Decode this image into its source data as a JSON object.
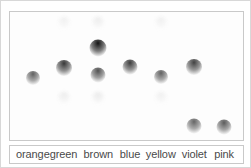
{
  "figure": {
    "kind": "paper-chromatography-plate",
    "plate_background": "#fdfdfd",
    "frame_color": "#c9c9c9",
    "outer_border_color": "#d8d8d8"
  },
  "legend": {
    "labels": [
      {
        "text": "orange",
        "x_pct": 9.8
      },
      {
        "text": "green",
        "x_pct": 23.0
      },
      {
        "text": "brown",
        "x_pct": 37.9
      },
      {
        "text": "blue",
        "x_pct": 51.5
      },
      {
        "text": "yellow",
        "x_pct": 64.7
      },
      {
        "text": "violet",
        "x_pct": 79.1
      },
      {
        "text": "pink",
        "x_pct": 91.9
      }
    ]
  },
  "chart_data": {
    "type": "scatter",
    "title": "",
    "xlabel": "",
    "ylabel": "",
    "categories": [
      "orange",
      "green",
      "brown",
      "blue",
      "yellow",
      "violet",
      "pink"
    ],
    "lane_x_pct": [
      9.8,
      23.0,
      37.9,
      51.5,
      64.7,
      79.1,
      91.9
    ],
    "grid": false,
    "legend_position": "bottom",
    "note": "Each lane shows the separated pigment spots for one ink colour; darkness indicates spot intensity, vertical position indicates migration distance.",
    "series": [
      {
        "name": "orange",
        "spots": [
          {
            "x_pct": 9.8,
            "y_pct": 51.5,
            "size": 14,
            "intensity": 0.62
          }
        ]
      },
      {
        "name": "green",
        "spots": [
          {
            "x_pct": 23.0,
            "y_pct": 8.5,
            "size": 13,
            "intensity": 0.06
          },
          {
            "x_pct": 23.0,
            "y_pct": 44.0,
            "size": 16,
            "intensity": 0.78
          },
          {
            "x_pct": 23.0,
            "y_pct": 67.5,
            "size": 13,
            "intensity": 0.07
          }
        ]
      },
      {
        "name": "brown",
        "spots": [
          {
            "x_pct": 37.9,
            "y_pct": 8.5,
            "size": 13,
            "intensity": 0.07
          },
          {
            "x_pct": 37.9,
            "y_pct": 28.5,
            "size": 17,
            "intensity": 0.92
          },
          {
            "x_pct": 37.9,
            "y_pct": 49.5,
            "size": 15,
            "intensity": 0.68
          },
          {
            "x_pct": 37.9,
            "y_pct": 67.5,
            "size": 13,
            "intensity": 0.08
          }
        ]
      },
      {
        "name": "blue",
        "spots": [
          {
            "x_pct": 51.5,
            "y_pct": 43.0,
            "size": 15,
            "intensity": 0.76
          }
        ]
      },
      {
        "name": "yellow",
        "spots": [
          {
            "x_pct": 64.7,
            "y_pct": 8.5,
            "size": 13,
            "intensity": 0.06
          },
          {
            "x_pct": 64.7,
            "y_pct": 50.5,
            "size": 14,
            "intensity": 0.62
          },
          {
            "x_pct": 64.7,
            "y_pct": 67.5,
            "size": 13,
            "intensity": 0.06
          }
        ]
      },
      {
        "name": "violet",
        "spots": [
          {
            "x_pct": 79.1,
            "y_pct": 43.0,
            "size": 16,
            "intensity": 0.74
          },
          {
            "x_pct": 79.1,
            "y_pct": 89.0,
            "size": 15,
            "intensity": 0.6
          }
        ]
      },
      {
        "name": "pink",
        "spots": [
          {
            "x_pct": 91.9,
            "y_pct": 90.0,
            "size": 15,
            "intensity": 0.64
          }
        ]
      }
    ]
  }
}
